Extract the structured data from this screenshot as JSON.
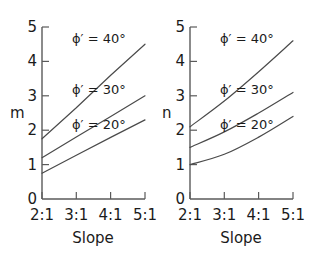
{
  "figure": {
    "background_color": "#ffffff",
    "line_color": "#4a4a4a",
    "axis_color": "#5a5a5a",
    "text_color": "#1b1b1b"
  },
  "chart_data": [
    {
      "type": "line",
      "id": "chart-m",
      "title": "",
      "xlabel": "Slope",
      "ylabel": "m",
      "x": [
        "2:1",
        "3:1",
        "4:1",
        "5:1"
      ],
      "xlim": [
        2,
        5
      ],
      "ylim": [
        0,
        5
      ],
      "yticks": [
        0,
        1,
        2,
        3,
        4,
        5
      ],
      "ytick_labels": [
        "0",
        "1",
        "2",
        "3",
        "4",
        "5"
      ],
      "xtick_labels": [
        "2:1",
        "3:1",
        "4:1",
        "5:1"
      ],
      "grid": false,
      "legend_position": "inline-annotations",
      "series": [
        {
          "name": "ϕ′ = 40°",
          "values": [
            1.75,
            2.65,
            3.6,
            4.5
          ]
        },
        {
          "name": "ϕ′ = 30°",
          "values": [
            1.2,
            1.8,
            2.4,
            3.0
          ]
        },
        {
          "name": "ϕ′ = 20°",
          "values": [
            0.75,
            1.27,
            1.79,
            2.3
          ]
        }
      ],
      "annotations": [
        {
          "text": "ϕ′ = 40°",
          "x": 3.95,
          "y": 4.55
        },
        {
          "text": "ϕ′ = 30°",
          "x": 3.95,
          "y": 3.05
        },
        {
          "text": "ϕ′ = 20°",
          "x": 3.95,
          "y": 2.05
        }
      ]
    },
    {
      "type": "line",
      "id": "chart-n",
      "title": "",
      "xlabel": "Slope",
      "ylabel": "n",
      "x": [
        "2:1",
        "3:1",
        "4:1",
        "5:1"
      ],
      "xlim": [
        2,
        5
      ],
      "ylim": [
        0,
        5
      ],
      "yticks": [
        0,
        1,
        2,
        3,
        4,
        5
      ],
      "ytick_labels": [
        "0",
        "1",
        "2",
        "3",
        "4",
        "5"
      ],
      "xtick_labels": [
        "2:1",
        "3:1",
        "4:1",
        "5:1"
      ],
      "grid": false,
      "legend_position": "inline-annotations",
      "series": [
        {
          "name": "ϕ′ = 40°",
          "values": [
            2.1,
            2.85,
            3.7,
            4.6
          ]
        },
        {
          "name": "ϕ′ = 30°",
          "values": [
            1.5,
            1.95,
            2.5,
            3.1
          ]
        },
        {
          "name": "ϕ′ = 20°",
          "values": [
            1.0,
            1.3,
            1.8,
            2.4
          ]
        }
      ],
      "annotations": [
        {
          "text": "ϕ′ = 40°",
          "x": 3.95,
          "y": 4.55
        },
        {
          "text": "ϕ′ = 30°",
          "x": 3.95,
          "y": 3.05
        },
        {
          "text": "ϕ′ = 20°",
          "x": 3.95,
          "y": 2.05
        }
      ]
    }
  ],
  "left_chart": {
    "ylabel": "m",
    "xlabel": "Slope",
    "yticks": {
      "t5": "5",
      "t4": "4",
      "t3": "3",
      "t2": "2",
      "t1": "1",
      "t0": "0"
    },
    "xticks": {
      "x1": "2:1",
      "x2": "3:1",
      "x3": "4:1",
      "x4": "5:1"
    },
    "labels": {
      "phi40": "ϕ′ = 40°",
      "phi30": "ϕ′ = 30°",
      "phi20": "ϕ′ = 20°"
    }
  },
  "right_chart": {
    "ylabel": "n",
    "xlabel": "Slope",
    "yticks": {
      "t5": "5",
      "t4": "4",
      "t3": "3",
      "t2": "2",
      "t1": "1",
      "t0": "0"
    },
    "xticks": {
      "x1": "2:1",
      "x2": "3:1",
      "x3": "4:1",
      "x4": "5:1"
    },
    "labels": {
      "phi40": "ϕ′ = 40°",
      "phi30": "ϕ′ = 30°",
      "phi20": "ϕ′ = 20°"
    }
  }
}
